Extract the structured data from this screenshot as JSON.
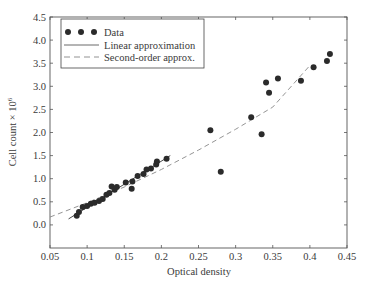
{
  "chart_data": {
    "type": "scatter",
    "title": "",
    "xlabel": "Optical density",
    "ylabel": "Cell count × 10",
    "ylabel_superscript": "6",
    "xlim": [
      0.05,
      0.45
    ],
    "ylim": [
      -0.5,
      4.5
    ],
    "xticks": [
      "0.05",
      "0.1",
      "0.15",
      "0.2",
      "0.25",
      "0.3",
      "0.35",
      "0.4",
      "0.45"
    ],
    "yticks": [
      "0.0",
      "0.5",
      "1.0",
      "1.5",
      "2.0",
      "2.5",
      "3.0",
      "3.5",
      "4.0",
      "4.5"
    ],
    "grid": false,
    "legend_position": "upper left",
    "legend": [
      "Data",
      "Linear approximation",
      "Second-order approx."
    ],
    "series": [
      {
        "name": "Data",
        "kind": "points",
        "x": [
          0.086,
          0.089,
          0.094,
          0.1,
          0.105,
          0.11,
          0.116,
          0.121,
          0.126,
          0.13,
          0.133,
          0.137,
          0.14,
          0.152,
          0.16,
          0.161,
          0.168,
          0.176,
          0.18,
          0.186,
          0.193,
          0.194,
          0.207,
          0.266,
          0.28,
          0.321,
          0.335,
          0.341,
          0.345,
          0.357,
          0.388,
          0.405,
          0.423,
          0.427
        ],
        "y": [
          0.2,
          0.28,
          0.39,
          0.41,
          0.46,
          0.48,
          0.52,
          0.56,
          0.65,
          0.69,
          0.83,
          0.76,
          0.82,
          0.92,
          0.78,
          0.94,
          1.06,
          1.1,
          1.2,
          1.22,
          1.31,
          1.37,
          1.43,
          2.05,
          1.15,
          2.33,
          1.96,
          3.08,
          2.86,
          3.17,
          3.12,
          3.41,
          3.55,
          3.7
        ]
      },
      {
        "name": "Linear approximation",
        "kind": "solid-line",
        "x": [
          0.075,
          0.212
        ],
        "y": [
          0.13,
          1.5
        ]
      },
      {
        "name": "Second-order approx.",
        "kind": "dashed-line",
        "x": [
          0.05,
          0.1,
          0.15,
          0.2,
          0.25,
          0.3,
          0.35,
          0.4
        ],
        "y": [
          0.17,
          0.48,
          0.82,
          1.2,
          1.62,
          2.07,
          2.55,
          3.45
        ]
      }
    ]
  }
}
